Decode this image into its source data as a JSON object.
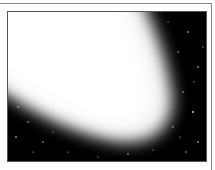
{
  "image": {
    "subject": "comet with bright tail against starfield",
    "colors": {
      "background": "#000000",
      "tail": "#ffffff",
      "frame": "#888888"
    }
  }
}
